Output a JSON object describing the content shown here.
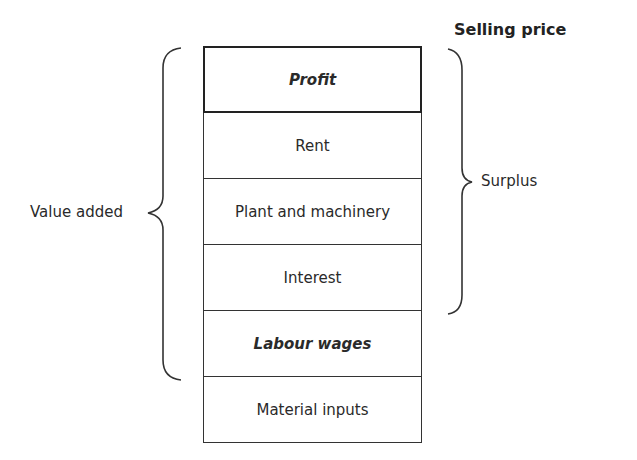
{
  "diagram": {
    "title": "Selling price",
    "rows": [
      {
        "label": "Profit",
        "emphasis": true
      },
      {
        "label": "Rent",
        "emphasis": false
      },
      {
        "label": "Plant and machinery",
        "emphasis": false
      },
      {
        "label": "Interest",
        "emphasis": false
      },
      {
        "label": "Labour wages",
        "emphasis": true
      },
      {
        "label": "Material inputs",
        "emphasis": false
      }
    ],
    "brackets": {
      "left": {
        "label": "Value added",
        "spans": [
          "Profit",
          "Rent",
          "Plant and machinery",
          "Interest",
          "Labour wages"
        ]
      },
      "right": {
        "label": "Surplus",
        "spans": [
          "Profit",
          "Rent",
          "Plant and machinery",
          "Interest"
        ]
      }
    }
  }
}
